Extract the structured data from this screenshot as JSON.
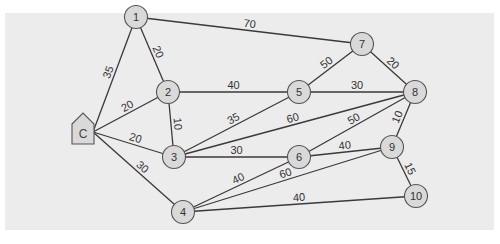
{
  "diagram": {
    "type": "weighted-network",
    "home_node": {
      "id": "C",
      "label": "C",
      "x": 83,
      "y": 130
    },
    "nodes": [
      {
        "id": "1",
        "label": "1",
        "x": 136,
        "y": 17
      },
      {
        "id": "2",
        "label": "2",
        "x": 168,
        "y": 92
      },
      {
        "id": "3",
        "label": "3",
        "x": 174,
        "y": 157
      },
      {
        "id": "4",
        "label": "4",
        "x": 183,
        "y": 212
      },
      {
        "id": "5",
        "label": "5",
        "x": 299,
        "y": 92
      },
      {
        "id": "6",
        "label": "6",
        "x": 299,
        "y": 157
      },
      {
        "id": "7",
        "label": "7",
        "x": 362,
        "y": 44
      },
      {
        "id": "8",
        "label": "8",
        "x": 415,
        "y": 92
      },
      {
        "id": "9",
        "label": "9",
        "x": 392,
        "y": 147
      },
      {
        "id": "10",
        "label": "10",
        "x": 416,
        "y": 196
      }
    ],
    "edges": [
      {
        "from": "C",
        "to": "1",
        "weight": "35"
      },
      {
        "from": "C",
        "to": "2",
        "weight": "20"
      },
      {
        "from": "C",
        "to": "3",
        "weight": "20"
      },
      {
        "from": "C",
        "to": "4",
        "weight": "30"
      },
      {
        "from": "1",
        "to": "2",
        "weight": "20"
      },
      {
        "from": "1",
        "to": "7",
        "weight": "70"
      },
      {
        "from": "2",
        "to": "5",
        "weight": "40"
      },
      {
        "from": "2",
        "to": "3",
        "weight": "10"
      },
      {
        "from": "3",
        "to": "5",
        "weight": "35"
      },
      {
        "from": "3",
        "to": "8",
        "weight": "60"
      },
      {
        "from": "3",
        "to": "6",
        "weight": "30"
      },
      {
        "from": "5",
        "to": "7",
        "weight": "50"
      },
      {
        "from": "5",
        "to": "8",
        "weight": "30"
      },
      {
        "from": "7",
        "to": "8",
        "weight": "20"
      },
      {
        "from": "6",
        "to": "8",
        "weight": "50"
      },
      {
        "from": "6",
        "to": "9",
        "weight": "40"
      },
      {
        "from": "8",
        "to": "9",
        "weight": "10"
      },
      {
        "from": "4",
        "to": "6",
        "weight": "40"
      },
      {
        "from": "4",
        "to": "9",
        "weight": "60"
      },
      {
        "from": "4",
        "to": "10",
        "weight": "40"
      },
      {
        "from": "9",
        "to": "10",
        "weight": "15"
      }
    ],
    "colors": {
      "panel_background": "#ececec",
      "node_fill": "#d9d9d9",
      "node_stroke": "#555555",
      "edge_stroke": "#3a3a3a"
    }
  }
}
